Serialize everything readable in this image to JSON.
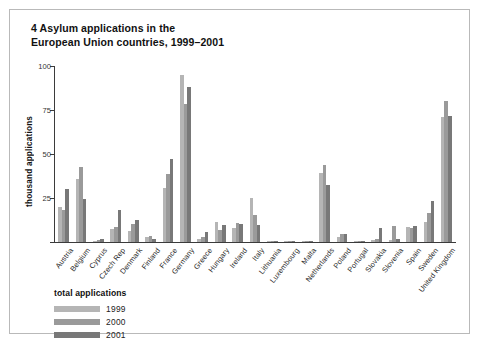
{
  "figure": {
    "title": "4 Asylum applications in the\nEuropean Union countries, 1999–2001",
    "title_line1": "4 Asylum applications in the",
    "title_line2": "European Union countries, 1999–2001"
  },
  "legend": {
    "heading": "total applications",
    "entries": [
      {
        "label": "1999",
        "color": "#b5b5b5"
      },
      {
        "label": "2000",
        "color": "#9a9a9a"
      },
      {
        "label": "2001",
        "color": "#787878"
      }
    ]
  },
  "axes": {
    "ylabel": "thousand applications",
    "yticks": [
      "0",
      "25",
      "50",
      "75",
      "100"
    ]
  },
  "chart_data": {
    "type": "bar",
    "title": "4 Asylum applications in the European Union countries, 1999–2001",
    "xlabel": "",
    "ylabel": "thousand applications",
    "ylim": [
      0,
      100
    ],
    "yticks": [
      0,
      25,
      50,
      75,
      100
    ],
    "grid": false,
    "legend_position": "below-axes-left",
    "legend_title": "total applications",
    "categories": [
      "Austria",
      "Belgium",
      "Cyprus",
      "Czech Rep",
      "Denmark",
      "Finland",
      "France",
      "Germany",
      "Greece",
      "Hungary",
      "Ireland",
      "Italy",
      "Lithuania",
      "Luxembourg",
      "Malta",
      "Netherlands",
      "Poland",
      "Portugal",
      "Slovakia",
      "Slovenia",
      "Spain",
      "Sweden",
      "United Kingdom"
    ],
    "series": [
      {
        "name": "1999",
        "color": "#b5b5b5",
        "values": [
          20.1,
          35.8,
          0.8,
          7.2,
          6.5,
          3.1,
          30.9,
          95.1,
          1.5,
          11.5,
          7.7,
          25.0,
          0.1,
          0.1,
          0.1,
          39.3,
          3.1,
          0.3,
          1.3,
          0.9,
          8.4,
          11.2,
          71.2
        ]
      },
      {
        "name": "2000",
        "color": "#9a9a9a",
        "values": [
          18.3,
          42.7,
          1.0,
          8.8,
          10.3,
          3.2,
          38.7,
          78.6,
          3.1,
          7.1,
          10.9,
          15.6,
          0.2,
          0.6,
          0.1,
          43.9,
          4.6,
          0.2,
          1.6,
          9.2,
          7.9,
          16.3,
          80.3
        ]
      },
      {
        "name": "2001",
        "color": "#787878",
        "values": [
          30.1,
          24.5,
          1.6,
          18.1,
          12.5,
          1.7,
          47.3,
          88.3,
          5.5,
          9.6,
          10.3,
          9.6,
          0.3,
          0.7,
          0.1,
          32.6,
          4.5,
          0.2,
          8.2,
          1.5,
          9.2,
          23.5,
          71.7
        ]
      }
    ]
  }
}
